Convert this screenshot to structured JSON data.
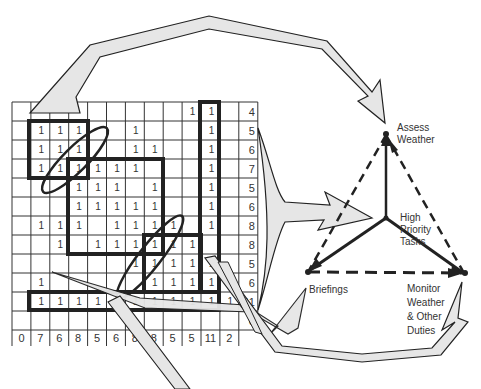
{
  "grid": {
    "rows": [
      {
        "cells": [
          0,
          0,
          0,
          0,
          0,
          0,
          0,
          0,
          0,
          1,
          1,
          0
        ],
        "sum": "4"
      },
      {
        "cells": [
          0,
          1,
          1,
          1,
          0,
          0,
          1,
          0,
          0,
          0,
          1,
          0
        ],
        "sum": "5"
      },
      {
        "cells": [
          0,
          1,
          1,
          1,
          0,
          0,
          1,
          1,
          0,
          0,
          1,
          0
        ],
        "sum": "6"
      },
      {
        "cells": [
          0,
          1,
          1,
          1,
          1,
          1,
          1,
          0,
          0,
          0,
          1,
          0
        ],
        "sum": "7"
      },
      {
        "cells": [
          0,
          0,
          0,
          1,
          1,
          1,
          0,
          1,
          0,
          0,
          1,
          0
        ],
        "sum": "5"
      },
      {
        "cells": [
          0,
          0,
          0,
          1,
          1,
          1,
          1,
          1,
          0,
          0,
          1,
          0
        ],
        "sum": "6"
      },
      {
        "cells": [
          0,
          1,
          1,
          1,
          0,
          1,
          1,
          1,
          1,
          0,
          1,
          0
        ],
        "sum": "8"
      },
      {
        "cells": [
          0,
          0,
          1,
          0,
          1,
          1,
          1,
          1,
          1,
          1,
          0,
          0
        ],
        "sum": "8"
      },
      {
        "cells": [
          0,
          0,
          0,
          0,
          0,
          0,
          1,
          1,
          1,
          1,
          1,
          0
        ],
        "sum": "5"
      },
      {
        "cells": [
          0,
          1,
          0,
          0,
          0,
          0,
          0,
          1,
          1,
          1,
          1,
          1
        ],
        "sum": "6"
      },
      {
        "cells": [
          0,
          1,
          1,
          1,
          1,
          1,
          1,
          1,
          1,
          1,
          1,
          1
        ],
        "sum": "11"
      },
      {
        "cells": [
          0,
          0,
          0,
          0,
          0,
          0,
          0,
          0,
          0,
          0,
          0,
          0
        ],
        "sum": "0"
      }
    ],
    "column_sums": [
      "0",
      "7",
      "6",
      "8",
      "5",
      "6",
      "8",
      "8",
      "5",
      "5",
      "11",
      "2"
    ],
    "cell_mark": "1"
  },
  "nodes": {
    "assess": {
      "line1": "Assess",
      "line2": "Weather"
    },
    "high_priority": {
      "line1": "High",
      "line2": "Priority",
      "line3": "Tasks"
    },
    "briefings": {
      "label": "Briefings"
    },
    "monitor": {
      "line1": "Monitor",
      "line2": "Weather",
      "line3": "& Other",
      "line4": "Duties"
    }
  },
  "colors": {
    "line": "#222222",
    "arrow_fill": "#e6e6e6",
    "grid_line": "#333333",
    "text": "#333333"
  }
}
